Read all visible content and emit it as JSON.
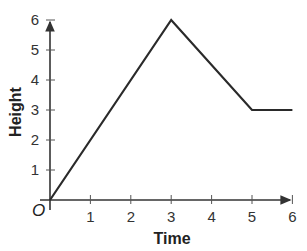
{
  "chart_data": {
    "type": "line",
    "title": "",
    "xlabel": "Time",
    "ylabel": "Height",
    "origin_label": "O",
    "x_ticks": [
      "1",
      "2",
      "3",
      "4",
      "5",
      "6"
    ],
    "y_ticks": [
      "1",
      "2",
      "3",
      "4",
      "5",
      "6"
    ],
    "xlim": [
      0,
      6
    ],
    "ylim": [
      0,
      6
    ],
    "grid": false,
    "series": [
      {
        "name": "Height",
        "x": [
          0,
          3,
          5,
          6
        ],
        "y": [
          0,
          6,
          3,
          3
        ]
      }
    ],
    "line_color": "#2a2a2a"
  }
}
